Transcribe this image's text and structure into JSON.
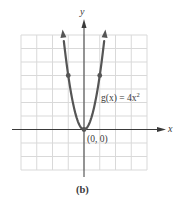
{
  "chart_data": {
    "type": "line",
    "title": "",
    "caption": "(b)",
    "xlabel": "x",
    "ylabel": "y",
    "xlim": [
      -4,
      4
    ],
    "ylim": [
      -3,
      7
    ],
    "grid": true,
    "grid_step": 1,
    "legend": null,
    "series": [
      {
        "name": "g(x) = 4x²",
        "function": "4x^2",
        "color": "#555555",
        "arrows_at_ends": true,
        "x": [
          -1.32,
          -1,
          -0.75,
          -0.5,
          -0.25,
          0,
          0.25,
          0.5,
          0.75,
          1,
          1.32
        ],
        "y": [
          6.97,
          4,
          2.25,
          1,
          0.25,
          0,
          0.25,
          1,
          2.25,
          4,
          6.97
        ]
      }
    ],
    "marked_points": [
      {
        "x": -1,
        "y": 4
      },
      {
        "x": 1,
        "y": 4
      },
      {
        "x": 0,
        "y": 0,
        "label": "(0, 0)"
      }
    ],
    "annotations": [
      {
        "text": "g(x) = 4x²",
        "near": {
          "x": 1.1,
          "y": 2.1
        }
      },
      {
        "text": "(0, 0)",
        "near": {
          "x": 0.2,
          "y": -0.7
        }
      }
    ]
  },
  "labels": {
    "x_axis": "x",
    "y_axis": "y",
    "function_label": "g(x) = 4x",
    "function_exponent": "2",
    "origin_label": "(0, 0)",
    "caption": "(b)"
  },
  "colors": {
    "grid": "#d9d9d9",
    "axis": "#3a3a3a",
    "curve": "#555555"
  }
}
